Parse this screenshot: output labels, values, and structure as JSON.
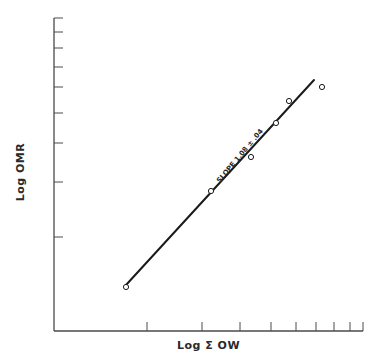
{
  "chart_data": {
    "type": "scatter",
    "title": "",
    "xlabel": "Log Σ OW",
    "ylabel": "Log OMR",
    "xscale": "log",
    "yscale": "log",
    "grid": false,
    "legend": null,
    "x_tick_labels": [],
    "y_tick_labels": [],
    "points_px": [
      {
        "x": 126,
        "y": 287
      },
      {
        "x": 211,
        "y": 191
      },
      {
        "x": 251,
        "y": 157
      },
      {
        "x": 276,
        "y": 123
      },
      {
        "x": 289,
        "y": 101
      },
      {
        "x": 322,
        "y": 87
      }
    ],
    "fit_line": {
      "x1": 126,
      "y1": 285,
      "x2": 314,
      "y2": 80
    },
    "annotation": "SLOPE 1.08 ± .04",
    "slope": 1.08,
    "slope_error": 0.04
  },
  "axes": {
    "origin": {
      "x": 54,
      "y": 331
    },
    "y_top": 18,
    "x_right": 363,
    "y_ticks_px": [
      18,
      32,
      48,
      67,
      87,
      113,
      143,
      182,
      237
    ],
    "x_ticks_px": [
      147,
      202,
      240,
      271,
      296,
      316,
      334,
      350,
      363
    ]
  },
  "labels": {
    "x_title": "Log Σ OW",
    "y_title": "Log OMR",
    "slope": "SLOPE 1.08 ± .04"
  },
  "colors": {
    "ink": "#1a1a1a",
    "axis": "#4a4a4a",
    "background": "#ffffff"
  }
}
